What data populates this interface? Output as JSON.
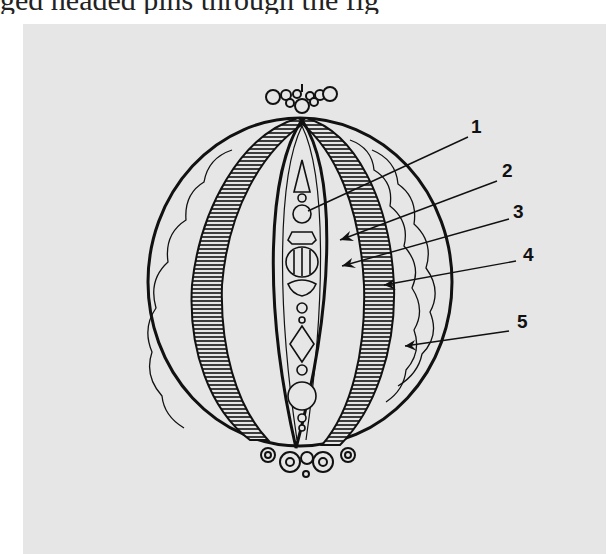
{
  "caption_fragment": "ged headed pins through the fig",
  "figure": {
    "background_color": "#e6e6e6",
    "line_color": "#111111",
    "labels": [
      {
        "id": "1",
        "text": "1",
        "x": 471,
        "y": 116,
        "pointer_to": [
          308,
          211
        ]
      },
      {
        "id": "2",
        "text": "2",
        "x": 502,
        "y": 160,
        "pointer_to": [
          340,
          240
        ]
      },
      {
        "id": "3",
        "text": "3",
        "x": 513,
        "y": 201,
        "pointer_to": [
          342,
          266
        ]
      },
      {
        "id": "4",
        "text": "4",
        "x": 523,
        "y": 244,
        "pointer_to": [
          384,
          285
        ]
      },
      {
        "id": "5",
        "text": "5",
        "x": 517,
        "y": 311,
        "pointer_to": [
          405,
          346
        ]
      }
    ]
  }
}
